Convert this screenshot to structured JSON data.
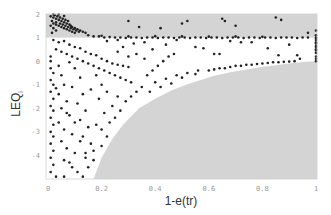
{
  "chart_data": {
    "type": "scatter",
    "title": "",
    "xlabel": "1-e(tr)",
    "ylabel": "LEQ",
    "ylabel_subscript": "i",
    "xlim": [
      0,
      1
    ],
    "ylim": [
      -5,
      2
    ],
    "x_ticks": [
      {
        "value": 0,
        "label": "0"
      },
      {
        "value": 0.2,
        "label": "0.2"
      },
      {
        "value": 0.4,
        "label": "0.4"
      },
      {
        "value": 0.6,
        "label": "0.6"
      },
      {
        "value": 0.8,
        "label": "0.8"
      },
      {
        "value": 1,
        "label": "1"
      }
    ],
    "y_ticks": [
      {
        "value": 2,
        "label": "2"
      },
      {
        "value": 1,
        "label": "1"
      },
      {
        "value": 0,
        "label": "0"
      },
      {
        "value": -1,
        "label": "-1"
      },
      {
        "value": -2,
        "label": "-2"
      },
      {
        "value": -3,
        "label": "-3"
      },
      {
        "value": -4,
        "label": "-4"
      }
    ],
    "grid": false,
    "legend": null,
    "shaded_regions": [
      {
        "name": "upper-band",
        "y_from": 1,
        "y_to": 2,
        "x_from": 0,
        "x_to": 1,
        "color": "#d4d4d4"
      },
      {
        "name": "lower-infeasible-region",
        "color": "#d4d4d4",
        "boundary": [
          [
            0.17,
            -5
          ],
          [
            0.2,
            -4.1
          ],
          [
            0.24,
            -3.3
          ],
          [
            0.28,
            -2.7
          ],
          [
            0.34,
            -2.0
          ],
          [
            0.4,
            -1.6
          ],
          [
            0.46,
            -1.25
          ],
          [
            0.52,
            -0.98
          ],
          [
            0.57,
            -0.8
          ],
          [
            0.62,
            -0.62
          ],
          [
            0.68,
            -0.47
          ],
          [
            0.74,
            -0.35
          ],
          [
            0.79,
            -0.26
          ],
          [
            0.85,
            -0.17
          ],
          [
            0.9,
            -0.1
          ],
          [
            0.95,
            -0.04
          ],
          [
            1.0,
            0
          ]
        ]
      }
    ],
    "point_color": "#222222",
    "series": [
      {
        "name": "observations",
        "points": [
          [
            0.01,
            1.9
          ],
          [
            0.02,
            1.85
          ],
          [
            0.025,
            1.95
          ],
          [
            0.03,
            1.8
          ],
          [
            0.035,
            1.9
          ],
          [
            0.04,
            1.75
          ],
          [
            0.045,
            1.85
          ],
          [
            0.05,
            1.7
          ],
          [
            0.055,
            1.8
          ],
          [
            0.06,
            1.65
          ],
          [
            0.065,
            1.75
          ],
          [
            0.07,
            1.6
          ],
          [
            0.075,
            1.7
          ],
          [
            0.08,
            1.55
          ],
          [
            0.085,
            1.5
          ],
          [
            0.09,
            1.45
          ],
          [
            0.1,
            1.4
          ],
          [
            0.11,
            1.35
          ],
          [
            0.12,
            1.3
          ],
          [
            0.13,
            1.25
          ],
          [
            0.14,
            1.2
          ],
          [
            0.015,
            1.7
          ],
          [
            0.02,
            1.6
          ],
          [
            0.03,
            1.55
          ],
          [
            0.04,
            1.5
          ],
          [
            0.05,
            1.45
          ],
          [
            0.06,
            1.4
          ],
          [
            0.07,
            1.35
          ],
          [
            0.08,
            1.3
          ],
          [
            0.09,
            1.25
          ],
          [
            0.1,
            1.2
          ],
          [
            0.03,
            1.65
          ],
          [
            0.045,
            1.6
          ],
          [
            0.055,
            1.55
          ],
          [
            0.065,
            1.5
          ],
          [
            0.075,
            1.45
          ],
          [
            0.085,
            1.4
          ],
          [
            0.095,
            1.35
          ],
          [
            0.105,
            1.3
          ],
          [
            0.115,
            1.25
          ],
          [
            0.02,
            1.98
          ],
          [
            0.04,
            1.98
          ],
          [
            0.06,
            1.92
          ],
          [
            0.03,
            1.3
          ],
          [
            0.02,
            1.4
          ],
          [
            0.01,
            1.5
          ],
          [
            0.015,
            1.2
          ],
          [
            0.15,
            1.1
          ],
          [
            0.17,
            1.05
          ],
          [
            0.19,
            1.05
          ],
          [
            0.21,
            1.0
          ],
          [
            0.23,
            1.02
          ],
          [
            0.25,
            1.0
          ],
          [
            0.27,
            1.0
          ],
          [
            0.29,
            0.98
          ],
          [
            0.31,
            1.0
          ],
          [
            0.33,
            1.0
          ],
          [
            0.35,
            0.98
          ],
          [
            0.37,
            1.0
          ],
          [
            0.39,
            1.0
          ],
          [
            0.41,
            0.98
          ],
          [
            0.43,
            1.0
          ],
          [
            0.45,
            1.0
          ],
          [
            0.47,
            0.98
          ],
          [
            0.49,
            1.0
          ],
          [
            0.51,
            1.0
          ],
          [
            0.53,
            0.98
          ],
          [
            0.55,
            1.0
          ],
          [
            0.57,
            1.0
          ],
          [
            0.59,
            0.98
          ],
          [
            0.61,
            1.0
          ],
          [
            0.63,
            1.0
          ],
          [
            0.65,
            0.98
          ],
          [
            0.67,
            1.0
          ],
          [
            0.69,
            1.0
          ],
          [
            0.71,
            1.0
          ],
          [
            0.73,
            0.98
          ],
          [
            0.75,
            1.0
          ],
          [
            0.77,
            1.0
          ],
          [
            0.79,
            0.98
          ],
          [
            0.81,
            1.0
          ],
          [
            0.83,
            1.0
          ],
          [
            0.85,
            0.98
          ],
          [
            0.87,
            1.0
          ],
          [
            0.89,
            1.0
          ],
          [
            0.91,
            1.0
          ],
          [
            0.93,
            0.98
          ],
          [
            0.95,
            1.0
          ],
          [
            0.97,
            1.0
          ],
          [
            0.2,
            1.08
          ],
          [
            0.3,
            1.05
          ],
          [
            0.4,
            1.06
          ],
          [
            0.5,
            1.05
          ],
          [
            0.6,
            1.04
          ],
          [
            0.7,
            1.05
          ],
          [
            0.8,
            1.03
          ],
          [
            0.5,
            1.6
          ],
          [
            0.52,
            1.7
          ],
          [
            0.65,
            1.8
          ],
          [
            0.66,
            1.7
          ],
          [
            0.7,
            1.5
          ],
          [
            0.42,
            1.4
          ],
          [
            0.85,
            1.85
          ],
          [
            0.87,
            1.75
          ],
          [
            0.97,
            1.2
          ],
          [
            0.3,
            1.7
          ],
          [
            0.34,
            1.45
          ],
          [
            1.0,
            1.3
          ],
          [
            1.0,
            1.1
          ],
          [
            1.0,
            0.95
          ],
          [
            1.0,
            0.8
          ],
          [
            1.0,
            0.65
          ],
          [
            1.0,
            0.5
          ],
          [
            1.0,
            0.35
          ],
          [
            1.0,
            0.2
          ],
          [
            1.0,
            0.1
          ],
          [
            1.0,
            0.0
          ],
          [
            1.0,
            1.0
          ],
          [
            1.0,
            0.9
          ],
          [
            1.0,
            0.75
          ],
          [
            1.0,
            0.6
          ],
          [
            1.0,
            0.45
          ],
          [
            0.22,
            0.85
          ],
          [
            0.26,
            0.9
          ],
          [
            0.32,
            0.75
          ],
          [
            0.36,
            0.8
          ],
          [
            0.44,
            0.7
          ],
          [
            0.48,
            0.9
          ],
          [
            0.55,
            0.6
          ],
          [
            0.58,
            0.55
          ],
          [
            0.62,
            0.3
          ],
          [
            0.64,
            0.3
          ],
          [
            0.68,
            0.85
          ],
          [
            0.72,
            0.8
          ],
          [
            0.76,
            0.8
          ],
          [
            0.82,
            0.55
          ],
          [
            0.86,
            0.25
          ],
          [
            0.9,
            0.7
          ],
          [
            0.94,
            0.1
          ],
          [
            0.93,
            0.25
          ],
          [
            0.6,
            -0.4
          ],
          [
            0.62,
            -0.35
          ],
          [
            0.64,
            -0.3
          ],
          [
            0.66,
            -0.3
          ],
          [
            0.68,
            -0.25
          ],
          [
            0.7,
            -0.2
          ],
          [
            0.72,
            -0.2
          ],
          [
            0.74,
            -0.15
          ],
          [
            0.76,
            -0.15
          ],
          [
            0.78,
            -0.12
          ],
          [
            0.8,
            -0.1
          ],
          [
            0.82,
            -0.08
          ],
          [
            0.84,
            -0.05
          ],
          [
            0.86,
            -0.05
          ],
          [
            0.88,
            -0.03
          ],
          [
            0.9,
            -0.02
          ],
          [
            0.92,
            0.0
          ],
          [
            0.55,
            -0.55
          ],
          [
            0.5,
            -0.7
          ],
          [
            0.46,
            -0.95
          ],
          [
            0.42,
            -1.1
          ],
          [
            0.38,
            -1.3
          ],
          [
            0.56,
            -0.4
          ],
          [
            0.52,
            -0.5
          ],
          [
            0.48,
            -0.6
          ],
          [
            0.44,
            -0.75
          ],
          [
            0.4,
            -0.9
          ],
          [
            0.02,
            0.9
          ],
          [
            0.04,
            0.8
          ],
          [
            0.06,
            0.85
          ],
          [
            0.08,
            0.7
          ],
          [
            0.1,
            0.6
          ],
          [
            0.12,
            0.55
          ],
          [
            0.14,
            0.4
          ],
          [
            0.16,
            0.3
          ],
          [
            0.18,
            0.25
          ],
          [
            0.2,
            0.1
          ],
          [
            0.22,
            0.0
          ],
          [
            0.24,
            -0.1
          ],
          [
            0.26,
            -0.15
          ],
          [
            0.28,
            -0.2
          ],
          [
            0.3,
            -0.25
          ],
          [
            0.03,
            0.5
          ],
          [
            0.05,
            0.4
          ],
          [
            0.07,
            0.3
          ],
          [
            0.09,
            0.2
          ],
          [
            0.11,
            0.1
          ],
          [
            0.13,
            0.0
          ],
          [
            0.15,
            -0.1
          ],
          [
            0.17,
            -0.2
          ],
          [
            0.19,
            -0.3
          ],
          [
            0.21,
            -0.4
          ],
          [
            0.23,
            -0.5
          ],
          [
            0.25,
            -0.6
          ],
          [
            0.27,
            -0.7
          ],
          [
            0.29,
            -0.8
          ],
          [
            0.31,
            -0.9
          ],
          [
            0.01,
            0.2
          ],
          [
            0.01,
            0.0
          ],
          [
            0.01,
            -0.3
          ],
          [
            0.02,
            -0.5
          ],
          [
            0.01,
            -0.8
          ],
          [
            0.02,
            -1.0
          ],
          [
            0.01,
            -1.3
          ],
          [
            0.02,
            -1.6
          ],
          [
            0.01,
            -1.9
          ],
          [
            0.02,
            -2.1
          ],
          [
            0.01,
            -2.4
          ],
          [
            0.02,
            -2.7
          ],
          [
            0.01,
            -3.0
          ],
          [
            0.02,
            -3.2
          ],
          [
            0.01,
            -3.5
          ],
          [
            0.02,
            -3.8
          ],
          [
            0.01,
            -4.1
          ],
          [
            0.02,
            -4.4
          ],
          [
            0.01,
            -4.7
          ],
          [
            0.03,
            -4.9
          ],
          [
            0.06,
            -4.9
          ],
          [
            0.04,
            -0.2
          ],
          [
            0.05,
            -0.6
          ],
          [
            0.06,
            -1.0
          ],
          [
            0.04,
            -1.4
          ],
          [
            0.07,
            -1.7
          ],
          [
            0.05,
            -2.0
          ],
          [
            0.08,
            -2.3
          ],
          [
            0.04,
            -2.6
          ],
          [
            0.06,
            -2.9
          ],
          [
            0.09,
            -3.1
          ],
          [
            0.05,
            -3.4
          ],
          [
            0.07,
            -3.7
          ],
          [
            0.1,
            -3.9
          ],
          [
            0.06,
            -4.2
          ],
          [
            0.09,
            -4.5
          ],
          [
            0.11,
            -4.7
          ],
          [
            0.13,
            -4.9
          ],
          [
            0.1,
            -0.3
          ],
          [
            0.12,
            -0.7
          ],
          [
            0.09,
            -1.1
          ],
          [
            0.13,
            -1.4
          ],
          [
            0.11,
            -1.8
          ],
          [
            0.14,
            -2.1
          ],
          [
            0.12,
            -2.5
          ],
          [
            0.15,
            -2.8
          ],
          [
            0.13,
            -3.2
          ],
          [
            0.16,
            -3.5
          ],
          [
            0.14,
            -3.9
          ],
          [
            0.17,
            -4.2
          ],
          [
            0.15,
            -4.5
          ],
          [
            0.18,
            -0.6
          ],
          [
            0.2,
            -1.0
          ],
          [
            0.22,
            -1.3
          ],
          [
            0.19,
            -1.6
          ],
          [
            0.24,
            -1.9
          ],
          [
            0.21,
            -2.2
          ],
          [
            0.23,
            -2.6
          ],
          [
            0.2,
            -2.9
          ],
          [
            0.22,
            -3.2
          ],
          [
            0.25,
            -2.4
          ],
          [
            0.27,
            -2.1
          ],
          [
            0.29,
            -1.7
          ],
          [
            0.31,
            -1.5
          ],
          [
            0.33,
            -1.3
          ],
          [
            0.35,
            -1.1
          ],
          [
            0.37,
            -0.6
          ],
          [
            0.39,
            -0.4
          ],
          [
            0.41,
            -0.2
          ],
          [
            0.43,
            0.0
          ],
          [
            0.45,
            0.2
          ],
          [
            0.47,
            0.3
          ],
          [
            0.33,
            0.3
          ],
          [
            0.36,
            0.1
          ],
          [
            0.39,
            0.5
          ],
          [
            0.26,
            0.4
          ],
          [
            0.28,
            0.6
          ],
          [
            0.3,
            0.2
          ],
          [
            0.08,
            -0.05
          ],
          [
            0.16,
            -1.2
          ],
          [
            0.26,
            -1.5
          ],
          [
            0.18,
            -2.7
          ],
          [
            0.2,
            -3.6
          ],
          [
            0.17,
            -3.8
          ],
          [
            0.03,
            -1.15
          ],
          [
            0.07,
            -2.2
          ],
          [
            0.1,
            -2.6
          ],
          [
            0.12,
            -3.4
          ],
          [
            0.14,
            -4.1
          ],
          [
            0.08,
            -4.3
          ]
        ]
      }
    ]
  }
}
